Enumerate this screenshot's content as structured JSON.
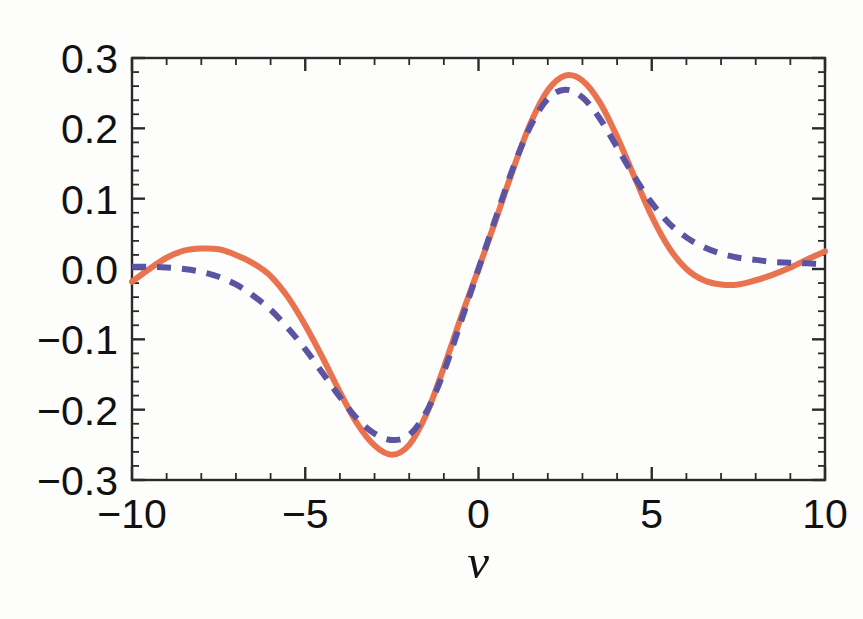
{
  "chart_data": {
    "type": "line",
    "title": "",
    "xlabel": "ν",
    "ylabel": "",
    "xlim": [
      -10,
      10
    ],
    "ylim": [
      -0.3,
      0.3
    ],
    "grid": false,
    "legend": "none",
    "frame": true,
    "tick_direction": "in",
    "xticks": [
      -10,
      -5,
      0,
      5,
      10
    ],
    "xticklabels": [
      "-10",
      "-5",
      "0",
      "5",
      "10"
    ],
    "x_minor_ticks_between": 4,
    "yticks": [
      0.3,
      0.2,
      0.1,
      0.0,
      -0.1,
      -0.2,
      -0.3
    ],
    "yticklabels": [
      "0.3",
      "0.2",
      "0.1",
      "0.0",
      "-0.1",
      "-0.2",
      "-0.3"
    ],
    "y_minor_ticks_between": 4,
    "x": [
      -10.0,
      -9.5,
      -9.0,
      -8.5,
      -8.0,
      -7.5,
      -7.0,
      -6.5,
      -6.0,
      -5.5,
      -5.0,
      -4.5,
      -4.0,
      -3.5,
      -3.0,
      -2.5,
      -2.0,
      -1.5,
      -1.0,
      -0.5,
      0.0,
      0.5,
      1.0,
      1.5,
      2.0,
      2.5,
      3.0,
      3.5,
      4.0,
      4.5,
      5.0,
      5.5,
      6.0,
      6.5,
      7.0,
      7.5,
      8.0,
      8.5,
      9.0,
      9.5,
      10.0
    ],
    "series": [
      {
        "name": "solid-curve",
        "style": "solid",
        "color": "#E8734E",
        "linewidth": 6,
        "values": [
          -0.018,
          0.0,
          0.016,
          0.026,
          0.029,
          0.028,
          0.02,
          0.008,
          -0.01,
          -0.04,
          -0.08,
          -0.126,
          -0.175,
          -0.22,
          -0.251,
          -0.264,
          -0.25,
          -0.206,
          -0.14,
          -0.068,
          0.0,
          0.07,
          0.142,
          0.207,
          0.254,
          0.275,
          0.268,
          0.237,
          0.188,
          0.131,
          0.075,
          0.03,
          0.0,
          -0.016,
          -0.022,
          -0.022,
          -0.016,
          -0.008,
          0.002,
          0.014,
          0.025
        ]
      },
      {
        "name": "dashed-curve",
        "style": "dashed",
        "color": "#5B54A3",
        "linewidth": 6,
        "dash": "14 11",
        "values": [
          0.003,
          0.003,
          0.002,
          0.0,
          -0.004,
          -0.011,
          -0.022,
          -0.038,
          -0.058,
          -0.084,
          -0.114,
          -0.148,
          -0.182,
          -0.213,
          -0.234,
          -0.243,
          -0.236,
          -0.203,
          -0.146,
          -0.074,
          0.0,
          0.073,
          0.144,
          0.203,
          0.242,
          0.255,
          0.244,
          0.214,
          0.173,
          0.131,
          0.094,
          0.065,
          0.045,
          0.031,
          0.022,
          0.016,
          0.013,
          0.01,
          0.009,
          0.008,
          0.007
        ]
      }
    ],
    "annotations": []
  }
}
